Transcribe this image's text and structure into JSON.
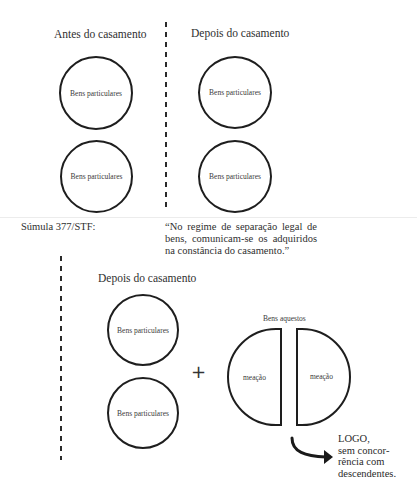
{
  "top_section": {
    "left_heading": "Antes do casamento",
    "right_heading": "Depois do casamento",
    "left_circles": [
      {
        "label": "Bens particulares"
      },
      {
        "label": "Bens particulares"
      }
    ],
    "right_circles": [
      {
        "label": "Bens particulares"
      },
      {
        "label": "Bens particulares"
      }
    ]
  },
  "sumula": {
    "label": "Súmula 377/STF:",
    "quote": "“No regime de separação legal de bens, comunicam-se os adquiridos na constância do casamento.”"
  },
  "bottom_section": {
    "heading": "Depois do casamento",
    "circles": [
      {
        "label": "Bens particulares"
      },
      {
        "label": "Bens particulares"
      }
    ],
    "plus_symbol": "+",
    "aquestos": {
      "title": "Bens aquestos",
      "left_half": "meação",
      "right_half": "meação"
    },
    "conclusion": {
      "line1": "LOGO,",
      "line2": "sem concor-",
      "line3": "rência com",
      "line4": "descendentes."
    }
  },
  "colors": {
    "stroke": "#1e1e1e",
    "text": "#2f2f2f",
    "background": "#ffffff"
  }
}
